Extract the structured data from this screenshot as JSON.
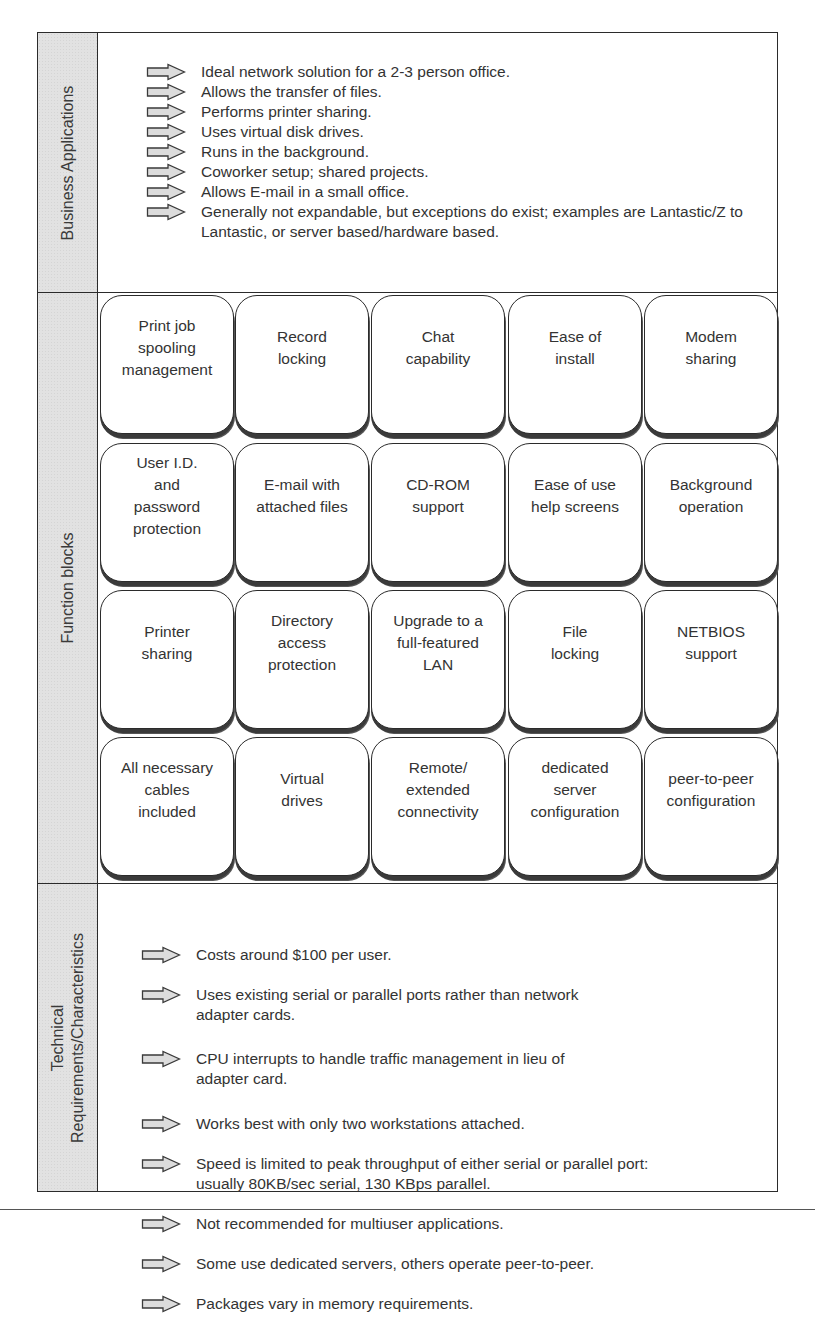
{
  "sections": {
    "business": {
      "label": "Business Applications",
      "items": [
        "Ideal network solution for a 2-3 person office.",
        "Allows the transfer of files.",
        "Performs printer sharing.",
        "Uses virtual disk drives.",
        "Runs in the background.",
        "Coworker setup; shared projects.",
        "Allows E-mail in a small office.",
        "Generally not expandable, but exceptions do exist; examples are Lantastic/Z to Lantastic, or server based/hardware based."
      ]
    },
    "function": {
      "label": "Function blocks",
      "rows": [
        [
          "Print job\nspooling\nmanagement",
          "Record\nlocking",
          "Chat\ncapability",
          "Ease of\ninstall",
          "Modem\nsharing"
        ],
        [
          "User I.D.\nand\npassword\nprotection",
          "E-mail with\nattached files",
          "CD-ROM\nsupport",
          "Ease of use\nhelp screens",
          "Background\noperation"
        ],
        [
          "Printer\nsharing",
          "Directory\naccess\nprotection",
          "Upgrade to a\nfull-featured\nLAN",
          "File\nlocking",
          "NETBIOS\nsupport"
        ],
        [
          "All necessary\ncables\nincluded",
          "Virtual\ndrives",
          "Remote/\nextended\nconnectivity",
          "dedicated\nserver\nconfiguration",
          "peer-to-peer\nconfiguration"
        ]
      ]
    },
    "technical": {
      "label_line1": "Technical",
      "label_line2": "Requirements/Characteristics",
      "items": [
        "Costs around $100 per user.",
        "Uses existing serial or parallel ports rather than network\nadapter cards.",
        "CPU interrupts to handle traffic management in lieu of\nadapter card.",
        "Works best with only two workstations attached.",
        "Speed is limited to peak throughput of either serial or parallel port:\nusually 80KB/sec serial, 130 KBps parallel.",
        "Not recommended for multiuser applications.",
        "Some use dedicated servers, others operate peer-to-peer.",
        "Packages vary in memory requirements."
      ]
    }
  },
  "icons": {
    "bullet": "right-arrow-outline"
  },
  "colors": {
    "sidebar_fill": "#e2e2e2",
    "border": "#2b2b2b",
    "arrow_fill": "#dcdcdc",
    "text": "#333333"
  }
}
